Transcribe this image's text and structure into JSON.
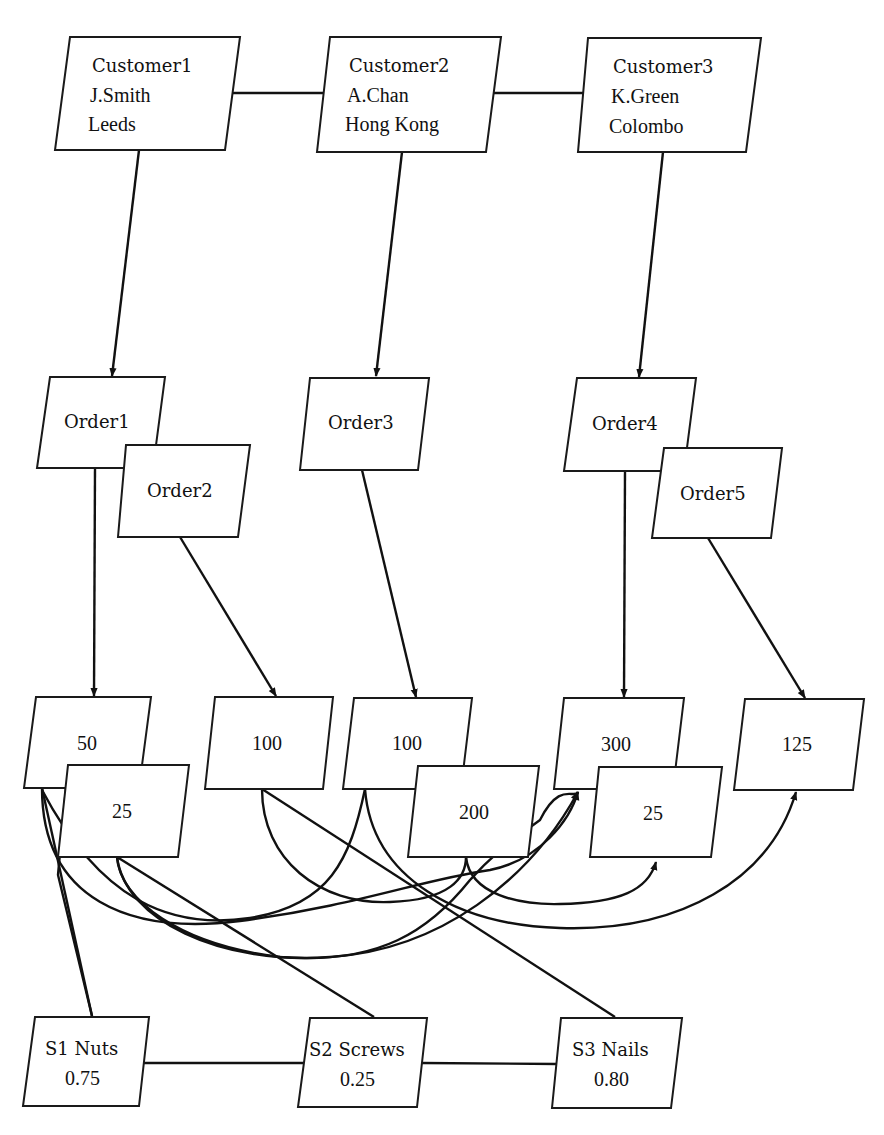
{
  "diagram": {
    "type": "network-database-instance",
    "colors": {
      "stroke": "#111111",
      "fill": "#ffffff",
      "background": "#ffffff"
    },
    "customers": [
      {
        "id": "customer1",
        "label": "Customer1",
        "name": "J.Smith",
        "city": "Leeds",
        "poly": "70,37 240,37 225,150 55,150",
        "tx": 92,
        "ty": [
          72,
          102,
          131
        ]
      },
      {
        "id": "customer2",
        "label": "Customer2",
        "name": "A.Chan",
        "city": "Hong Kong",
        "poly": "330,37 501,37 486,152 317,152",
        "tx": 349,
        "ty": [
          72,
          102,
          131
        ]
      },
      {
        "id": "customer3",
        "label": "Customer3",
        "name": "K.Green",
        "city": "Colombo",
        "poly": "588,38 761,38 746,152 578,152",
        "tx": 613,
        "ty": [
          73,
          103,
          133
        ]
      }
    ],
    "orders": [
      {
        "id": "order1",
        "label": "Order1",
        "poly": "50,377 165,377 153,468 37,468",
        "tx": 64,
        "ty": 428
      },
      {
        "id": "order2",
        "label": "Order2",
        "poly": "126,445 250,445 238,537 118,537",
        "tx": 147,
        "ty": 497
      },
      {
        "id": "order3",
        "label": "Order3",
        "poly": "310,378 429,378 418,470 300,470",
        "tx": 328,
        "ty": 429
      },
      {
        "id": "order4",
        "label": "Order4",
        "poly": "577,378 696,378 684,471 564,471",
        "tx": 592,
        "ty": 430
      },
      {
        "id": "order5",
        "label": "Order5",
        "poly": "664,448 782,448 771,538 652,538",
        "tx": 680,
        "ty": 500
      }
    ],
    "quantities": [
      {
        "id": "qty-50",
        "label": "50",
        "poly": "36,697 151,697 139,788 24,788",
        "tx": 77,
        "ty": 750
      },
      {
        "id": "qty-25-a",
        "label": "25",
        "poly": "68,765 189,765 178,857 58,857",
        "tx": 112,
        "ty": 818
      },
      {
        "id": "qty-100-a",
        "label": "100",
        "poly": "215,697 333,697 323,789 205,789",
        "tx": 252,
        "ty": 750
      },
      {
        "id": "qty-100-b",
        "label": "100",
        "poly": "354,698 472,698 461,789 343,789",
        "tx": 392,
        "ty": 750
      },
      {
        "id": "qty-200",
        "label": "200",
        "poly": "418,766 539,766 528,857 408,857",
        "tx": 459,
        "ty": 819
      },
      {
        "id": "qty-300",
        "label": "300",
        "poly": "564,698 684,698 673,789 554,789",
        "tx": 601,
        "ty": 751
      },
      {
        "id": "qty-25-b",
        "label": "25",
        "poly": "599,767 722,767 711,857 590,857",
        "tx": 643,
        "ty": 820
      },
      {
        "id": "qty-125",
        "label": "125",
        "poly": "745,699 864,699 853,790 734,790",
        "tx": 782,
        "ty": 751
      }
    ],
    "suppliers": [
      {
        "id": "s1",
        "label": "S1 Nuts",
        "price": "0.75",
        "poly": "35,1017 149,1017 139,1106 23,1106",
        "tx": 45,
        "ty": [
          1055,
          1085
        ],
        "px": 65
      },
      {
        "id": "s2",
        "label": "S2 Screws",
        "price": "0.25",
        "poly": "310,1018 427,1018 417,1107 298,1107",
        "tx": 309,
        "ty": [
          1056,
          1086
        ],
        "px": 340
      },
      {
        "id": "s3",
        "label": "S3 Nails",
        "price": "0.80",
        "poly": "561,1018 682,1018 671,1108 552,1108",
        "tx": 572,
        "ty": [
          1056,
          1086
        ],
        "px": 594
      }
    ],
    "edges": [
      {
        "id": "customer1-customer2",
        "d": "M232,93 L324,93",
        "arrow": false
      },
      {
        "id": "customer2-customer3",
        "d": "M493,93 L585,93",
        "arrow": false
      },
      {
        "id": "supplier1-supplier2",
        "d": "M144,1063 L304,1063",
        "arrow": false
      },
      {
        "id": "supplier2-supplier3",
        "d": "M422,1063 L557,1064",
        "arrow": false
      },
      {
        "id": "customer1-order1",
        "d": "M139,150 L112,376",
        "arrow": true
      },
      {
        "id": "customer2-order3",
        "d": "M402,152 L376,376",
        "arrow": true
      },
      {
        "id": "customer3-order4",
        "d": "M663,152 L639,377",
        "arrow": true
      },
      {
        "id": "order1-qty50",
        "d": "M95,468 L94,696",
        "arrow": true
      },
      {
        "id": "order2-qty100a",
        "d": "M180,537 L276,696",
        "arrow": true
      },
      {
        "id": "order3-qty100b",
        "d": "M362,470 L416,697",
        "arrow": true
      },
      {
        "id": "order4-qty300",
        "d": "M625,471 L624,697",
        "arrow": true
      },
      {
        "id": "order5-qty125",
        "d": "M708,538 L805,698",
        "arrow": true
      },
      {
        "id": "qty50-qty300",
        "d": "M42,788 C42,900 130,935 240,921 C360,905 420,880 490,870 C540,860 570,820 578,792",
        "arrow": true
      },
      {
        "id": "qty50-supplier1",
        "d": "M42,788 L92,1016",
        "arrow": false
      },
      {
        "id": "qty25a-supplier1",
        "d": "M68,766 L58,875 L92,1016",
        "arrow": false
      },
      {
        "id": "qty25a-qty200",
        "d": "M117,857 C120,900 180,945 280,957 C380,965 430,930 470,880 C480,870 485,860 540,820 C560,780 575,800 578,792",
        "arrow": false
      },
      {
        "id": "qty25a-supplier2",
        "d": "M117,857 L374,1017",
        "arrow": false
      },
      {
        "id": "qty100a-supplier3",
        "d": "M262,789 L615,1017",
        "arrow": false
      },
      {
        "id": "qty100a-qty200",
        "d": "M262,789 C262,860 320,905 390,902 C450,900 466,878 466,857",
        "arrow": false
      },
      {
        "id": "qty100b-qty25a",
        "d": "M365,789 C350,860 330,905 250,918 C170,930 100,900 42,790",
        "arrow": false
      },
      {
        "id": "qty100b-qty125",
        "d": "M365,789 C372,880 460,925 560,928 C680,932 770,880 796,792",
        "arrow": true
      },
      {
        "id": "qty200-qty25b",
        "d": "M466,857 C470,895 520,905 560,904 C620,903 648,890 656,862",
        "arrow": true
      },
      {
        "id": "qty25a-qty300-curve",
        "d": "M117,857 C125,920 220,965 330,957 C440,950 530,880 578,792",
        "arrow": true
      }
    ]
  }
}
